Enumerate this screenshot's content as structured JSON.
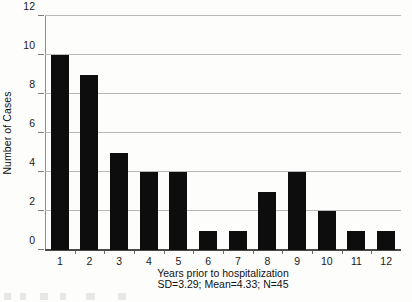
{
  "chart_data": {
    "type": "bar",
    "title": "",
    "xlabel": "Years prior to hospitalization",
    "xsublabel": "SD=3.29; Mean=4.33; N=45",
    "ylabel": "Number of Cases",
    "categories": [
      "1",
      "2",
      "3",
      "4",
      "5",
      "6",
      "7",
      "8",
      "9",
      "10",
      "11",
      "12"
    ],
    "values": [
      10,
      9,
      5,
      4,
      4,
      1,
      1,
      3,
      4,
      2,
      1,
      1
    ],
    "ylim": [
      0,
      12
    ],
    "ytick_values": [
      0,
      2,
      4,
      6,
      8,
      10,
      12
    ],
    "ytick_labels": [
      "0",
      "2",
      "4",
      "6",
      "8",
      "10",
      "12"
    ],
    "grid": "horizontal",
    "legend": "none",
    "bar_color": "#0d0d0d",
    "grid_color": "#b9b9b9",
    "axis_color": "#4a4a4a",
    "background_color": "#fdfdfc",
    "statistics": {
      "sd": "3.29",
      "mean": "4.33",
      "n": "45"
    }
  }
}
